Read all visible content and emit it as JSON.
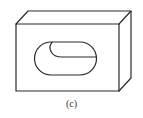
{
  "figure": {
    "caption": "(c)",
    "stroke_color": "#2a2a2a",
    "background": "#ffffff"
  }
}
